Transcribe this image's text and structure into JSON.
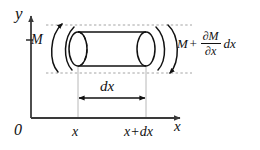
{
  "figure": {
    "type": "mechanics-free-body-diagram",
    "background_color": "#ffffff",
    "line_color": "#111111",
    "guide_color": "#b0b0b0",
    "dash_color": "#9a9a9a"
  },
  "axes": {
    "y_label": "y",
    "x_label": "x",
    "origin_label": "0",
    "y_axis": {
      "x": 31,
      "top": 14,
      "bottom": 118
    },
    "x_axis": {
      "y": 118,
      "left": 31,
      "right": 182
    },
    "y_tick_label": "M",
    "y_tick_y": 40
  },
  "ticks": {
    "left_label": "x",
    "right_label": "x+dx",
    "left_x": 78,
    "right_x": 146
  },
  "cylinder": {
    "left_x": 78,
    "right_x": 146,
    "top_y": 32,
    "bottom_y": 66,
    "ellipse_rx": 9,
    "ellipse_ry": 17,
    "hidden_edge_style": "dashed",
    "fill": "#ffffff"
  },
  "labels": {
    "moment_left": "M",
    "moment_right_base": "M",
    "moment_right_plus": "+",
    "moment_right_numerator": "∂M",
    "moment_right_denominator": "∂x",
    "moment_right_differential": "dx",
    "length_label": "dx"
  },
  "dimension": {
    "label": "dx",
    "arrow_y": 98,
    "from_x": 78,
    "to_x": 146,
    "style": "double-headed"
  },
  "torque_arcs": {
    "left_count": 2,
    "right_count": 2,
    "left_direction": "counterclockwise-up",
    "right_direction": "clockwise-down"
  },
  "dashed_guides": {
    "top_y": 25,
    "bottom_y": 73,
    "from_x": 46,
    "to_x": 192
  }
}
